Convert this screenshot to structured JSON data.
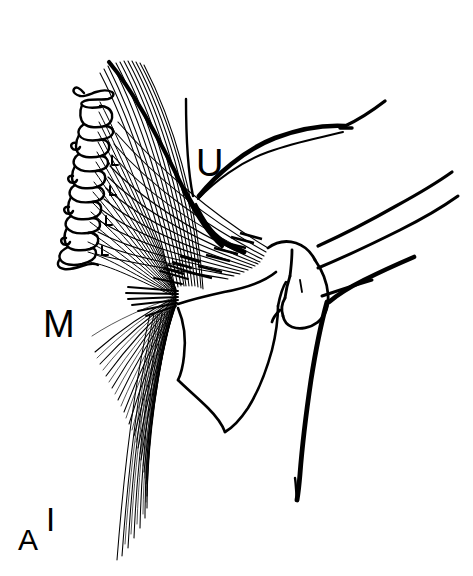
{
  "figure": {
    "kind": "anatomical-line-drawing",
    "background_color": "#ffffff",
    "ink_color": "#000000",
    "width": 473,
    "height": 576
  },
  "orientation_labels": [
    {
      "key": "U",
      "text": "U",
      "meaning": "superior"
    },
    {
      "key": "M",
      "text": "M",
      "meaning": "medial"
    },
    {
      "key": "A",
      "text": "A",
      "meaning": "anterior"
    },
    {
      "key": "I",
      "text": "I",
      "meaning": "inferior"
    }
  ],
  "labels": {
    "superior": "U",
    "medial": "M",
    "anterior": "A",
    "inferior": "I"
  },
  "structures": [
    {
      "name": "vertebral-column",
      "description": "stack of cervicothoracic vertebrae with spinous processes along the left margin"
    },
    {
      "name": "fan-shaped-muscle",
      "description": "broad triangular muscle with radiating fibers converging on a tendinous insertion"
    },
    {
      "name": "muscle-insertion",
      "description": "dense convergence of fibers at the humeral insertion"
    },
    {
      "name": "scapula",
      "description": "shoulder blade body and inferior angle"
    },
    {
      "name": "humeral-head",
      "description": "rounded proximal humerus with greater tubercle"
    },
    {
      "name": "humerus-shaft",
      "description": "long bone shaft descending to lower right"
    },
    {
      "name": "clavicle",
      "description": "curved bone running to the upper right"
    }
  ]
}
